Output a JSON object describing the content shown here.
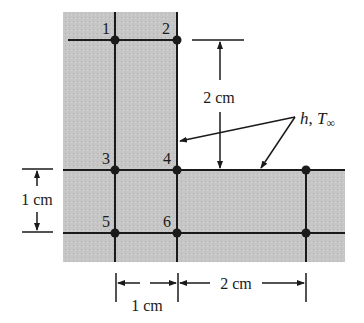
{
  "diagram": {
    "title": "",
    "colors": {
      "solid_fill": "#c4c4c4",
      "line": "#1a1a1a",
      "background": "#ffffff"
    },
    "nodes": [
      {
        "id": "1",
        "label": "1",
        "x": 115,
        "y": 40
      },
      {
        "id": "2",
        "label": "2",
        "x": 177,
        "y": 40
      },
      {
        "id": "3",
        "label": "3",
        "x": 115,
        "y": 170
      },
      {
        "id": "4",
        "label": "4",
        "x": 177,
        "y": 170
      },
      {
        "id": "5",
        "label": "5",
        "x": 115,
        "y": 233
      },
      {
        "id": "6",
        "label": "6",
        "x": 177,
        "y": 233
      },
      {
        "id": "r1",
        "label": "",
        "x": 306,
        "y": 170
      },
      {
        "id": "r2",
        "label": "",
        "x": 306,
        "y": 233
      }
    ],
    "dimensions": {
      "vertical_right": "2 cm",
      "vertical_left": "1 cm",
      "horizontal_left": "1 cm",
      "horizontal_right": "2 cm"
    },
    "convection_label": {
      "h": "h",
      "sep": ", ",
      "T": "T",
      "sub": "∞"
    }
  }
}
